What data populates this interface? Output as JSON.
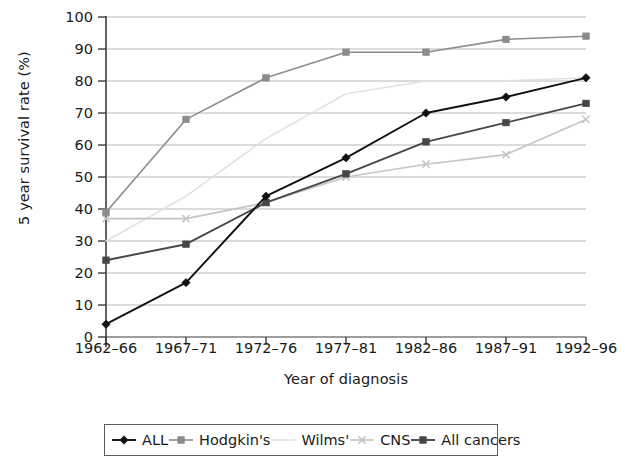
{
  "chart_data": {
    "type": "line",
    "title": "",
    "xlabel": "Year of diagnosis",
    "ylabel": "5 year survival rate (%)",
    "categories": [
      "1962–66",
      "1967–71",
      "1972–76",
      "1977–81",
      "1982–86",
      "1987–91",
      "1992–96"
    ],
    "ylim": [
      0,
      100
    ],
    "ytick_labels": [
      "0",
      "10",
      "20",
      "30",
      "40",
      "50",
      "60",
      "70",
      "80",
      "90",
      "100"
    ],
    "ytick_values": [
      0,
      10,
      20,
      30,
      40,
      50,
      60,
      70,
      80,
      90,
      100
    ],
    "grid": true,
    "grid_axis": "y",
    "legend_position": "bottom",
    "series": [
      {
        "name": "ALL",
        "values": [
          4,
          17,
          44,
          56,
          70,
          75,
          81
        ],
        "color": "#111111",
        "marker": "diamond"
      },
      {
        "name": "Hodgkin's",
        "values": [
          39,
          68,
          81,
          89,
          89,
          93,
          94
        ],
        "color": "#8c8c8c",
        "marker": "square"
      },
      {
        "name": "Wilms'",
        "values": [
          30,
          44,
          62,
          76,
          80,
          80,
          81
        ],
        "color": "#e2e2e2",
        "marker": "none"
      },
      {
        "name": "CNS",
        "values": [
          37,
          37,
          42,
          50,
          54,
          57,
          68
        ],
        "color": "#c4c4c4",
        "marker": "x"
      },
      {
        "name": "All cancers",
        "values": [
          24,
          29,
          42,
          51,
          61,
          67,
          73
        ],
        "color": "#474747",
        "marker": "square"
      }
    ]
  },
  "axes": {
    "y_axis_title": "5 year survival rate (%)",
    "x_axis_title": "Year of diagnosis"
  },
  "legend": {
    "entries": [
      {
        "label": "ALL"
      },
      {
        "label": "Hodgkin's"
      },
      {
        "label": "Wilms'"
      },
      {
        "label": "CNS"
      },
      {
        "label": "All cancers"
      }
    ]
  },
  "colors": {
    "axis": "#3c3c3c",
    "grid": "#b8b8b8",
    "background": "#ffffff",
    "text": "#1a1a1a"
  }
}
